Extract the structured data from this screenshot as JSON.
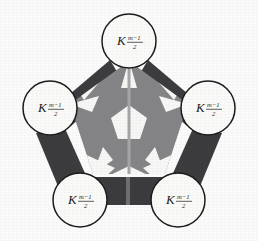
{
  "figure": {
    "type": "graph-diagram",
    "background_color": "#fbfbfb",
    "vertex_count": 5,
    "edge_count": 5
  },
  "colors": {
    "background": "#fbfbfb",
    "edge_bar": "#3b3b3d",
    "edge_bar_highlight": "#6e6e70",
    "inner_region": "#848487",
    "inner_cutout": "#f7f7f5",
    "node_fill": "#fafaf8",
    "node_stroke": "#1b1b1b",
    "label_text": "#1a1a1a"
  },
  "nodes": [
    {
      "id": "node-top",
      "position": "top",
      "cx": 129,
      "cy": 41,
      "r": 27,
      "label_base": "K",
      "label_subscript_numerator": "m−1",
      "label_subscript_denominator": "2"
    },
    {
      "id": "node-upper-left",
      "position": "upper-left",
      "cx": 50,
      "cy": 108,
      "r": 27,
      "label_base": "K",
      "label_subscript_numerator": "m−1",
      "label_subscript_denominator": "2"
    },
    {
      "id": "node-upper-right",
      "position": "upper-right",
      "cx": 208,
      "cy": 108,
      "r": 27,
      "label_base": "K",
      "label_subscript_numerator": "m−1",
      "label_subscript_denominator": "2"
    },
    {
      "id": "node-lower-left",
      "position": "lower-left",
      "cx": 80,
      "cy": 200,
      "r": 27,
      "label_base": "K",
      "label_subscript_numerator": "m−1",
      "label_subscript_denominator": "2"
    },
    {
      "id": "node-lower-right",
      "position": "lower-right",
      "cx": 178,
      "cy": 200,
      "r": 27,
      "label_base": "K",
      "label_subscript_numerator": "m−1",
      "label_subscript_denominator": "2"
    }
  ],
  "edges": [
    {
      "id": "edge-top-upperleft",
      "from": "node-top",
      "to": "node-upper-left"
    },
    {
      "id": "edge-top-upperright",
      "from": "node-top",
      "to": "node-upper-right"
    },
    {
      "id": "edge-upperleft-lowerleft",
      "from": "node-upper-left",
      "to": "node-lower-left"
    },
    {
      "id": "edge-upperright-lowerright",
      "from": "node-upper-right",
      "to": "node-lower-right"
    },
    {
      "id": "edge-lowerleft-lowerright",
      "from": "node-lower-left",
      "to": "node-lower-right"
    }
  ],
  "inner_region": {
    "id": "inner-pentagon",
    "shape": "pentagon",
    "center_x": 129,
    "center_y": 123,
    "outer_radius": 62,
    "fill": "#848487",
    "center_pentagon_radius": 19,
    "center_pentagon_fill": "#f7f7f5",
    "star_points": 5
  }
}
